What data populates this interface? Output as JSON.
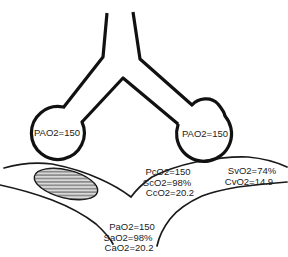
{
  "diagram": {
    "alveoli": {
      "left_label": "PAO2=150",
      "right_label": "PAO2=150"
    },
    "end_capillary": {
      "lines": [
        "PcO2=150",
        "ScO2=98%",
        "CcO2=20.2"
      ]
    },
    "mixed_venous": {
      "lines": [
        "SvO2=74%",
        "CvO2=14.9"
      ]
    },
    "arterial": {
      "lines": [
        "PaO2=150",
        "SaO2=98%",
        "CaO2=20.2"
      ]
    },
    "colors": {
      "line": "#111111",
      "vessel_line": "#1a1a1a",
      "clot_fill": "#d9d9d9",
      "hatch_line": "#4a4a4a",
      "background": "#ffffff"
    }
  }
}
